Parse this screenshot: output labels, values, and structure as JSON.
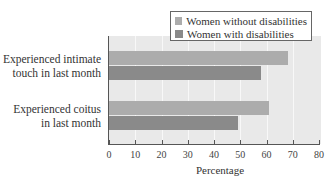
{
  "chart_data": {
    "type": "bar",
    "orientation": "horizontal",
    "title": "",
    "xlabel": "Percentage",
    "ylabel": "",
    "xlim": [
      0,
      80
    ],
    "xticks": [
      0,
      10,
      20,
      30,
      40,
      50,
      60,
      70,
      80
    ],
    "grid": "vertical",
    "legend_position": "top-right",
    "categories": [
      "Experienced intimate touch in last month",
      "Experienced coitus in last month"
    ],
    "series": [
      {
        "name": "Women without disabilities",
        "color": "#acacac",
        "values": [
          68,
          61
        ]
      },
      {
        "name": "Women with disabilities",
        "color": "#8a8a8a",
        "values": [
          58,
          49
        ]
      }
    ]
  },
  "labels": {
    "cat1_line1": "Experienced intimate",
    "cat1_line2": "touch in last month",
    "cat2_line1": "Experienced coitus",
    "cat2_line2": "in last month",
    "legend_without": "Women without disabilities",
    "legend_with": "Women with disabilities",
    "xlabel": "Percentage",
    "ticks": [
      "0",
      "10",
      "20",
      "30",
      "40",
      "50",
      "60",
      "70",
      "80"
    ]
  }
}
